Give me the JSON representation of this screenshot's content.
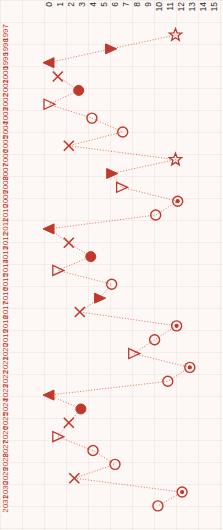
{
  "chart_data": {
    "type": "line",
    "title": "",
    "xlabel": "",
    "ylabel": "",
    "orientation": "horizontal-values-vertical-years",
    "grid": true,
    "legend": null,
    "accent_color": "#d94b2b",
    "marker_color": "#c0392b",
    "background_color": "#fdf8f5",
    "xlim": [
      0,
      15
    ],
    "x_ticks": [
      "0",
      "1",
      "2",
      "3",
      "4",
      "5",
      "6",
      "7",
      "8",
      "9",
      "10",
      "11",
      "12",
      "13",
      "14",
      "15"
    ],
    "categories": [
      "1997",
      "1998",
      "1999",
      "2000",
      "2001",
      "2002",
      "2003",
      "2004",
      "2005",
      "2006",
      "2007",
      "2008",
      "2009",
      "2010",
      "2011",
      "2012",
      "2013",
      "2014",
      "2015",
      "2016",
      "2017",
      "2018",
      "2019",
      "2020",
      "2021",
      "2022",
      "2023",
      "2024",
      "2025",
      "2026",
      "2027",
      "2028",
      "2029",
      "2030",
      "2031"
    ],
    "values": [
      11.5,
      5.6,
      0.0,
      0.8,
      2.7,
      0.0,
      3.9,
      6.7,
      1.8,
      11.5,
      5.7,
      6.6,
      11.7,
      9.7,
      0.0,
      1.8,
      3.8,
      0.8,
      5.7,
      4.6,
      2.8,
      11.6,
      9.6,
      7.7,
      12.8,
      10.8,
      0.0,
      2.9,
      1.8,
      0.8,
      4.0,
      6.0,
      2.3,
      12.1,
      9.9
    ],
    "markers": [
      "star",
      "triangle-right-filled",
      "triangle-left-filled",
      "x",
      "circle-filled",
      "triangle-right-open",
      "circle-open",
      "circle-open",
      "x",
      "star",
      "triangle-right-filled",
      "triangle-right-open",
      "circle-dot",
      "circle-open",
      "triangle-left-filled",
      "x",
      "circle-filled",
      "triangle-right-open",
      "circle-open",
      "triangle-right-filled",
      "x",
      "circle-dot",
      "circle-open",
      "triangle-right-open",
      "circle-dot",
      "circle-open",
      "triangle-left-filled",
      "circle-filled",
      "x",
      "triangle-right-open",
      "circle-open",
      "circle-open",
      "x",
      "circle-dot",
      "circle-open"
    ],
    "line_style": "dotted",
    "marker_size": 5
  }
}
